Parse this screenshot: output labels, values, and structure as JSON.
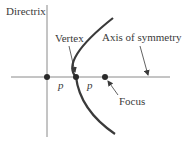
{
  "figure": {
    "type": "parabola-diagram",
    "labels": {
      "directrix": "Directrix",
      "vertex": "Vertex",
      "axis": "Axis of symmetry",
      "focus": "Focus",
      "p_left": "p",
      "p_right": "p"
    },
    "colors": {
      "line": "#8a8a8a",
      "curve": "#3a3a3a",
      "point": "#2a2a2a",
      "text": "#3a3a3a"
    },
    "points": {
      "directrix_intersection": {
        "x": 47,
        "y": 77
      },
      "vertex": {
        "x": 76,
        "y": 77
      },
      "focus": {
        "x": 105,
        "y": 77
      }
    }
  }
}
